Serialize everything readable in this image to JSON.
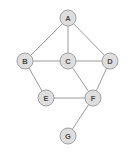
{
  "figure": {
    "width": 132,
    "height": 153,
    "background_color": "#ffffff"
  },
  "style": {
    "node_fill": "#dedede",
    "node_stroke": "#a0a0a0",
    "node_radius": 8,
    "node_label_color": "#4a4a4a",
    "edge_color": "#9a9a9a",
    "edge_width": 1
  },
  "chart_data": {
    "type": "diagram",
    "graph_type": "undirected",
    "title": "",
    "node_count": 7,
    "edge_count": 10,
    "nodes": [
      {
        "id": "A",
        "label": "A",
        "x": 68,
        "y": 18,
        "degree": 3
      },
      {
        "id": "B",
        "label": "B",
        "x": 25,
        "y": 61,
        "degree": 3
      },
      {
        "id": "C",
        "label": "C",
        "x": 68,
        "y": 61,
        "degree": 4
      },
      {
        "id": "D",
        "label": "D",
        "x": 110,
        "y": 61,
        "degree": 3
      },
      {
        "id": "E",
        "label": "E",
        "x": 46,
        "y": 98,
        "degree": 2
      },
      {
        "id": "F",
        "label": "F",
        "x": 93,
        "y": 98,
        "degree": 4
      },
      {
        "id": "G",
        "label": "G",
        "x": 68,
        "y": 136,
        "degree": 1
      }
    ],
    "edges": [
      {
        "source": "A",
        "target": "B"
      },
      {
        "source": "A",
        "target": "C"
      },
      {
        "source": "A",
        "target": "D"
      },
      {
        "source": "B",
        "target": "C"
      },
      {
        "source": "B",
        "target": "E"
      },
      {
        "source": "C",
        "target": "D"
      },
      {
        "source": "C",
        "target": "F"
      },
      {
        "source": "D",
        "target": "F"
      },
      {
        "source": "E",
        "target": "F"
      },
      {
        "source": "F",
        "target": "G"
      }
    ]
  }
}
